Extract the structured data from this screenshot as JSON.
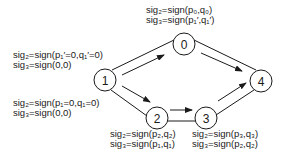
{
  "diagram": {
    "type": "directed-graph",
    "nodes": [
      {
        "id": "0",
        "label": "0",
        "cx": 184,
        "cy": 44
      },
      {
        "id": "1",
        "label": "1",
        "cx": 105,
        "cy": 80
      },
      {
        "id": "2",
        "label": "2",
        "cx": 157,
        "cy": 118
      },
      {
        "id": "3",
        "label": "3",
        "cx": 206,
        "cy": 118
      },
      {
        "id": "4",
        "label": "4",
        "cx": 261,
        "cy": 81
      }
    ],
    "edges": [
      {
        "from": "1",
        "to": "0"
      },
      {
        "from": "0",
        "to": "4"
      },
      {
        "from": "1",
        "to": "2"
      },
      {
        "from": "2",
        "to": "3"
      },
      {
        "from": "3",
        "to": "4"
      }
    ],
    "annotations": {
      "node0": {
        "line1": "sig₂=sign(p₀,q₀)",
        "line2": "sig₃=sign(p₁′,q₁′)"
      },
      "edge1to0": {
        "line1": "sig₂=sign(p₁′=0,q₁′=0)",
        "line2": "sig₃=sign(0,0)"
      },
      "edge1to2": {
        "line1": "sig₂=sign(p₁=0,q₁=0)",
        "line2": "sig₃=sign(0,0)"
      },
      "node2": {
        "line1": "sig₂=sign(p₂,q₂)",
        "line2": "sig₃=sign(p₁,q₁)"
      },
      "node3": {
        "line1": "sig₂=sign(p₃,q₃)",
        "line2": "sig₃=sign(p₂,q₂)"
      }
    },
    "colors": {
      "stroke": "#1a1a1a",
      "background": "#ffffff"
    }
  }
}
